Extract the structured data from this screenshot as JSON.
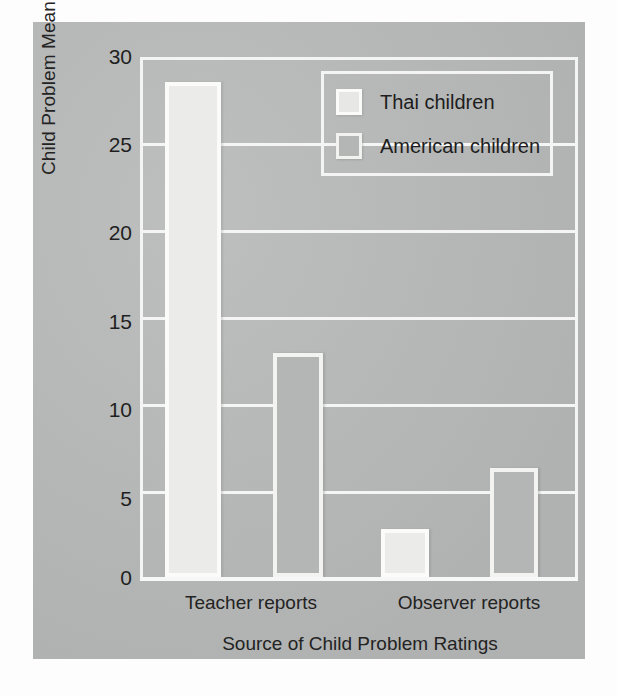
{
  "chart_data": {
    "type": "bar",
    "title": "",
    "xlabel": "Source of Child Problem Ratings",
    "ylabel": "Child Problem Mean Score",
    "categories": [
      "Teacher reports",
      "Observer reports"
    ],
    "series": [
      {
        "name": "Thai children",
        "values": [
          28.7,
          2.8
        ],
        "color": "#ebecea"
      },
      {
        "name": "American children",
        "values": [
          13.0,
          6.3
        ],
        "color": "#b4b6b5"
      }
    ],
    "ylim": [
      0,
      30
    ],
    "yticks": [
      0,
      5,
      10,
      15,
      20,
      25,
      30
    ],
    "ytick_labels": [
      "0",
      "5",
      "10",
      "15",
      "20",
      "25",
      "30"
    ],
    "grid": true,
    "grid_axis": "y",
    "legend_position": "top-right",
    "background_color": "#b9bbba",
    "grid_color": "#f4f5f4",
    "text_color": "#1f1f1f"
  },
  "legend": {
    "entries": [
      {
        "label": "Thai children",
        "swatch": "thai-swatch"
      },
      {
        "label": "American children",
        "swatch": "american-swatch"
      }
    ]
  },
  "axes": {
    "y_title": "Child Problem Mean Score",
    "x_title": "Source of Child Problem Ratings",
    "y_ticks": [
      "30",
      "25",
      "20",
      "15",
      "10",
      "5",
      "0"
    ],
    "x_ticks": [
      "Teacher reports",
      "Observer reports"
    ]
  }
}
